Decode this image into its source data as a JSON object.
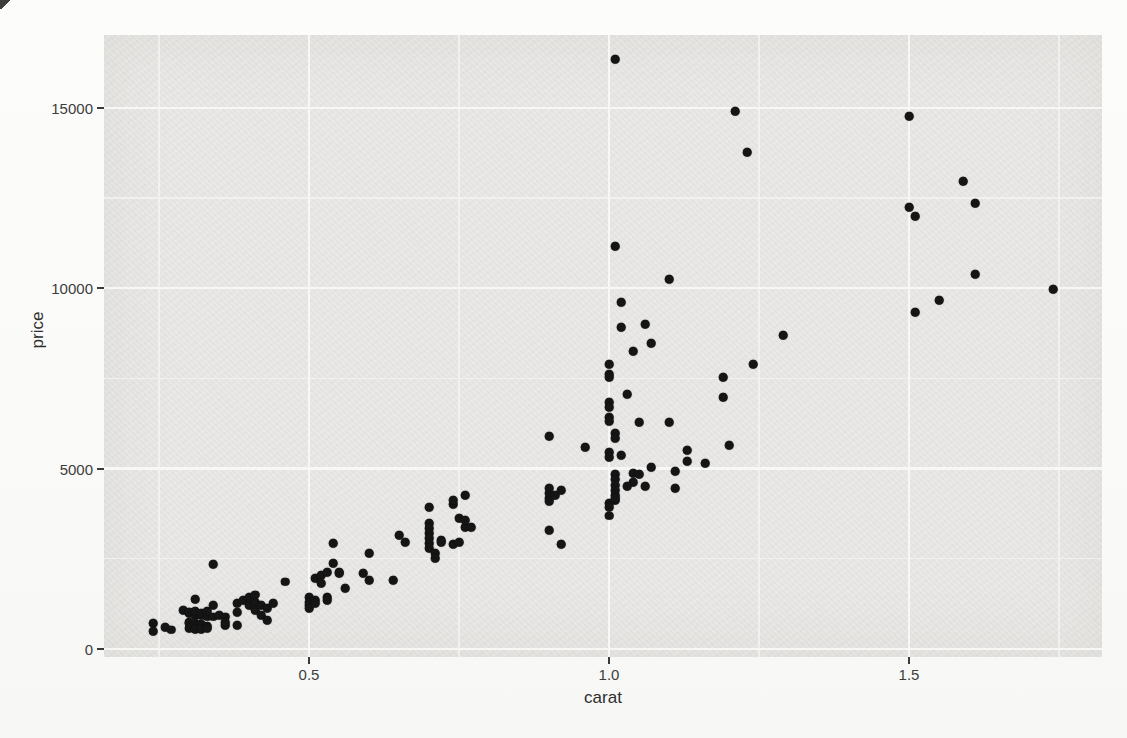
{
  "figure": {
    "kind": "photographed book page with an R ggplot2 scatter plot",
    "bleedthrough_line1": "the simple file code with aesthetics of each point showing the differences in",
    "bleedthrough_line2": "classes to control the"
  },
  "colors": {
    "page_bg": "#fbfbfa",
    "panel_bg": "#e9e8e6",
    "grid_major": "#f7f7f6",
    "grid_minor": "#f2f2f0",
    "point": "#151515",
    "axis_text": "#3d3d3d"
  },
  "chart_data": {
    "type": "scatter",
    "title": "",
    "xlabel": "carat",
    "ylabel": "price",
    "grid": true,
    "legend": false,
    "style": "ggplot2 gray theme",
    "xlim": [
      0.158,
      1.822
    ],
    "ylim": [
      -220,
      17010
    ],
    "x_ticks": [
      0.5,
      1.0,
      1.5
    ],
    "x_tick_labels": [
      "0.5",
      "1.0",
      "1.5"
    ],
    "x_minor_ticks": [
      0.25,
      0.75,
      1.25,
      1.75
    ],
    "y_ticks": [
      0,
      5000,
      10000,
      15000
    ],
    "y_tick_labels": [
      "0",
      "5000",
      "10000",
      "15000"
    ],
    "y_minor_ticks": [
      2500,
      7500,
      12500
    ],
    "points": [
      [
        0.24,
        720
      ],
      [
        0.24,
        500
      ],
      [
        0.26,
        610
      ],
      [
        0.27,
        530
      ],
      [
        0.29,
        1080
      ],
      [
        0.3,
        1000
      ],
      [
        0.3,
        1030
      ],
      [
        0.31,
        940
      ],
      [
        0.31,
        1050
      ],
      [
        0.31,
        1380
      ],
      [
        0.32,
        940
      ],
      [
        0.32,
        1000
      ],
      [
        0.33,
        890
      ],
      [
        0.33,
        1050
      ],
      [
        0.34,
        1220
      ],
      [
        0.34,
        890
      ],
      [
        0.35,
        940
      ],
      [
        0.3,
        750
      ],
      [
        0.3,
        720
      ],
      [
        0.31,
        660
      ],
      [
        0.31,
        720
      ],
      [
        0.32,
        660
      ],
      [
        0.32,
        690
      ],
      [
        0.33,
        640
      ],
      [
        0.3,
        580
      ],
      [
        0.31,
        550
      ],
      [
        0.32,
        550
      ],
      [
        0.33,
        580
      ],
      [
        0.36,
        660
      ],
      [
        0.36,
        890
      ],
      [
        0.36,
        750
      ],
      [
        0.34,
        2350
      ],
      [
        0.38,
        1270
      ],
      [
        0.38,
        1020
      ],
      [
        0.38,
        660
      ],
      [
        0.39,
        1360
      ],
      [
        0.4,
        1220
      ],
      [
        0.4,
        1440
      ],
      [
        0.41,
        1300
      ],
      [
        0.41,
        1500
      ],
      [
        0.41,
        1080
      ],
      [
        0.42,
        1220
      ],
      [
        0.42,
        940
      ],
      [
        0.43,
        1130
      ],
      [
        0.43,
        800
      ],
      [
        0.44,
        1270
      ],
      [
        0.46,
        1860
      ],
      [
        0.5,
        1440
      ],
      [
        0.5,
        1300
      ],
      [
        0.5,
        1220
      ],
      [
        0.5,
        1130
      ],
      [
        0.51,
        1360
      ],
      [
        0.51,
        1270
      ],
      [
        0.51,
        1970
      ],
      [
        0.52,
        1830
      ],
      [
        0.52,
        2050
      ],
      [
        0.53,
        1440
      ],
      [
        0.53,
        1360
      ],
      [
        0.53,
        2130
      ],
      [
        0.54,
        2940
      ],
      [
        0.54,
        2380
      ],
      [
        0.55,
        2130
      ],
      [
        0.55,
        2100
      ],
      [
        0.56,
        1690
      ],
      [
        0.59,
        2100
      ],
      [
        0.6,
        2660
      ],
      [
        0.6,
        1910
      ],
      [
        0.64,
        1910
      ],
      [
        0.65,
        3160
      ],
      [
        0.66,
        2960
      ],
      [
        0.7,
        3930
      ],
      [
        0.7,
        3490
      ],
      [
        0.7,
        3350
      ],
      [
        0.7,
        3210
      ],
      [
        0.7,
        3070
      ],
      [
        0.7,
        2940
      ],
      [
        0.7,
        2800
      ],
      [
        0.71,
        2660
      ],
      [
        0.71,
        2520
      ],
      [
        0.72,
        3020
      ],
      [
        0.72,
        2960
      ],
      [
        0.74,
        4020
      ],
      [
        0.74,
        4130
      ],
      [
        0.74,
        2910
      ],
      [
        0.75,
        2960
      ],
      [
        0.75,
        3630
      ],
      [
        0.76,
        4270
      ],
      [
        0.76,
        3380
      ],
      [
        0.76,
        3570
      ],
      [
        0.77,
        3380
      ],
      [
        0.9,
        4180
      ],
      [
        0.9,
        4320
      ],
      [
        0.9,
        4460
      ],
      [
        0.9,
        4100
      ],
      [
        0.91,
        4270
      ],
      [
        0.92,
        4400
      ],
      [
        0.9,
        3300
      ],
      [
        0.92,
        2910
      ],
      [
        0.9,
        5900
      ],
      [
        0.96,
        5600
      ],
      [
        1.01,
        16340
      ],
      [
        1.01,
        11160
      ],
      [
        1.02,
        9610
      ],
      [
        1.02,
        8920
      ],
      [
        1.06,
        9000
      ],
      [
        1.07,
        8470
      ],
      [
        1.04,
        8250
      ],
      [
        1.0,
        7890
      ],
      [
        1.0,
        7620
      ],
      [
        1.0,
        7530
      ],
      [
        1.03,
        7060
      ],
      [
        1.0,
        6840
      ],
      [
        1.0,
        6700
      ],
      [
        1.0,
        6430
      ],
      [
        1.0,
        6320
      ],
      [
        1.01,
        5980
      ],
      [
        1.01,
        5840
      ],
      [
        1.05,
        6290
      ],
      [
        1.1,
        6290
      ],
      [
        1.0,
        5460
      ],
      [
        1.0,
        5320
      ],
      [
        1.02,
        5370
      ],
      [
        1.01,
        4850
      ],
      [
        1.01,
        4710
      ],
      [
        1.01,
        4540
      ],
      [
        1.01,
        4400
      ],
      [
        1.01,
        4270
      ],
      [
        1.01,
        4130
      ],
      [
        1.0,
        4040
      ],
      [
        1.0,
        3930
      ],
      [
        1.0,
        3690
      ],
      [
        1.01,
        4180
      ],
      [
        1.04,
        4870
      ],
      [
        1.04,
        4630
      ],
      [
        1.03,
        4520
      ],
      [
        1.05,
        4850
      ],
      [
        1.06,
        4520
      ],
      [
        1.07,
        5040
      ],
      [
        1.11,
        4930
      ],
      [
        1.11,
        4460
      ],
      [
        1.13,
        5510
      ],
      [
        1.13,
        5210
      ],
      [
        1.16,
        5150
      ],
      [
        1.2,
        5650
      ],
      [
        1.19,
        7530
      ],
      [
        1.19,
        6980
      ],
      [
        1.24,
        7890
      ],
      [
        1.29,
        8690
      ],
      [
        1.1,
        10250
      ],
      [
        1.21,
        14900
      ],
      [
        1.23,
        13770
      ],
      [
        1.5,
        14760
      ],
      [
        1.5,
        12240
      ],
      [
        1.51,
        11990
      ],
      [
        1.51,
        9330
      ],
      [
        1.55,
        9670
      ],
      [
        1.59,
        12960
      ],
      [
        1.61,
        12350
      ],
      [
        1.61,
        10390
      ],
      [
        1.74,
        9970
      ]
    ]
  }
}
